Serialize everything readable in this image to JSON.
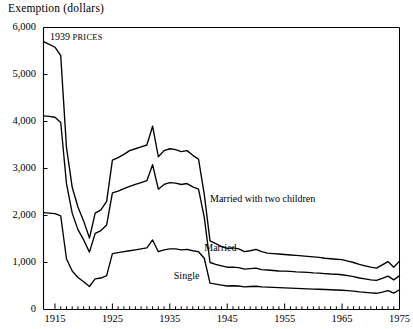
{
  "chart_data": {
    "type": "line",
    "title": "Exemption (dollars)",
    "xlabel": "",
    "ylabel": "Exemption (dollars)",
    "annotation": {
      "year": "1939",
      "word": "PRICES"
    },
    "xlim": [
      1913,
      1975
    ],
    "ylim": [
      0,
      6000
    ],
    "yticks": [
      0,
      1000,
      2000,
      3000,
      4000,
      5000,
      6000
    ],
    "ytick_labels": [
      "0",
      "1,000",
      "2,000",
      "3,000",
      "4,000",
      "5,000",
      "6,000"
    ],
    "xticks": [
      1915,
      1925,
      1935,
      1945,
      1955,
      1965,
      1975
    ],
    "xtick_labels": [
      "1915",
      "1925",
      "1935",
      "1945",
      "1955",
      "1965",
      "1975"
    ],
    "minor_tick_interval": 1,
    "grid": false,
    "legend": "inline-labels",
    "line_color": "#000000",
    "series": [
      {
        "name": "Married with two children",
        "label_x": 1942,
        "label_y": 2320,
        "x": [
          1913,
          1914,
          1915,
          1916,
          1917,
          1918,
          1919,
          1920,
          1921,
          1922,
          1923,
          1924,
          1925,
          1926,
          1927,
          1928,
          1929,
          1930,
          1931,
          1932,
          1933,
          1934,
          1935,
          1936,
          1937,
          1938,
          1939,
          1940,
          1941,
          1942,
          1943,
          1944,
          1945,
          1946,
          1947,
          1948,
          1949,
          1950,
          1951,
          1952,
          1953,
          1954,
          1955,
          1956,
          1957,
          1958,
          1959,
          1960,
          1961,
          1962,
          1963,
          1964,
          1965,
          1966,
          1967,
          1968,
          1969,
          1970,
          1971,
          1972,
          1973,
          1974,
          1975
        ],
        "values": [
          5700,
          5640,
          5580,
          5400,
          3450,
          2600,
          2180,
          1880,
          1520,
          2050,
          2120,
          2300,
          3180,
          3230,
          3300,
          3380,
          3420,
          3460,
          3500,
          3900,
          3250,
          3380,
          3420,
          3400,
          3360,
          3380,
          3280,
          3200,
          2450,
          1460,
          1400,
          1340,
          1300,
          1310,
          1290,
          1230,
          1250,
          1280,
          1230,
          1200,
          1190,
          1180,
          1170,
          1160,
          1150,
          1140,
          1130,
          1120,
          1110,
          1090,
          1080,
          1070,
          1060,
          1030,
          1000,
          960,
          930,
          900,
          880,
          950,
          1020,
          900,
          1030
        ]
      },
      {
        "name": "Married",
        "label_x": 1941,
        "label_y": 1290,
        "x": [
          1913,
          1914,
          1915,
          1916,
          1917,
          1918,
          1919,
          1920,
          1921,
          1922,
          1923,
          1924,
          1925,
          1926,
          1927,
          1928,
          1929,
          1930,
          1931,
          1932,
          1933,
          1934,
          1935,
          1936,
          1937,
          1938,
          1939,
          1940,
          1941,
          1942,
          1943,
          1944,
          1945,
          1946,
          1947,
          1948,
          1949,
          1950,
          1951,
          1952,
          1953,
          1954,
          1955,
          1956,
          1957,
          1958,
          1959,
          1960,
          1961,
          1962,
          1963,
          1964,
          1965,
          1966,
          1967,
          1968,
          1969,
          1970,
          1971,
          1972,
          1973,
          1974,
          1975
        ],
        "values": [
          4120,
          4110,
          4090,
          3980,
          2680,
          2050,
          1700,
          1480,
          1220,
          1620,
          1680,
          1800,
          2480,
          2520,
          2570,
          2620,
          2660,
          2700,
          2740,
          3080,
          2560,
          2660,
          2700,
          2690,
          2660,
          2680,
          2610,
          2560,
          1960,
          1000,
          960,
          930,
          900,
          900,
          890,
          860,
          870,
          880,
          850,
          840,
          830,
          820,
          815,
          810,
          800,
          795,
          790,
          780,
          775,
          765,
          755,
          750,
          740,
          720,
          700,
          670,
          650,
          630,
          620,
          660,
          710,
          630,
          720
        ]
      },
      {
        "name": "Single",
        "label_x": 1935,
        "label_y": 700,
        "x": [
          1913,
          1914,
          1915,
          1916,
          1917,
          1918,
          1919,
          1920,
          1921,
          1922,
          1923,
          1924,
          1925,
          1926,
          1927,
          1928,
          1929,
          1930,
          1931,
          1932,
          1933,
          1934,
          1935,
          1936,
          1937,
          1938,
          1939,
          1940,
          1941,
          1942,
          1943,
          1944,
          1945,
          1946,
          1947,
          1948,
          1949,
          1950,
          1951,
          1952,
          1953,
          1954,
          1955,
          1956,
          1957,
          1958,
          1959,
          1960,
          1961,
          1962,
          1963,
          1964,
          1965,
          1966,
          1967,
          1968,
          1969,
          1970,
          1971,
          1972,
          1973,
          1974,
          1975
        ],
        "values": [
          2060,
          2050,
          2040,
          1990,
          1080,
          820,
          680,
          590,
          490,
          650,
          670,
          720,
          1190,
          1210,
          1230,
          1250,
          1270,
          1290,
          1310,
          1480,
          1230,
          1270,
          1290,
          1290,
          1270,
          1280,
          1250,
          1230,
          1090,
          560,
          540,
          520,
          500,
          505,
          500,
          480,
          490,
          495,
          480,
          475,
          470,
          465,
          460,
          455,
          450,
          445,
          440,
          435,
          430,
          425,
          420,
          415,
          410,
          400,
          390,
          375,
          365,
          355,
          345,
          370,
          400,
          350,
          420
        ]
      }
    ]
  }
}
